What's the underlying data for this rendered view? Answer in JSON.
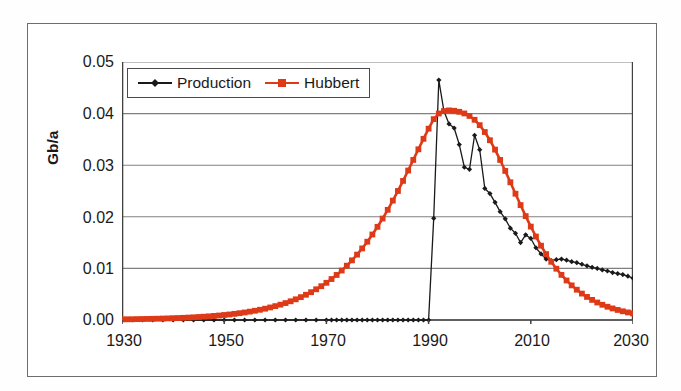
{
  "chart_data": {
    "type": "line",
    "title": "",
    "subtitle": "",
    "xlabel": "",
    "ylabel": "Gb/a",
    "xlim": [
      1930,
      2030
    ],
    "ylim": [
      0.0,
      0.05
    ],
    "xticks": [
      1930,
      1950,
      1970,
      1990,
      2010,
      2030
    ],
    "yticks": [
      "0.00",
      "0.01",
      "0.02",
      "0.03",
      "0.04",
      "0.05"
    ],
    "ytick_values": [
      0.0,
      0.01,
      0.02,
      0.03,
      0.04,
      0.05
    ],
    "grid": "horizontal",
    "legend_position": "upper-left-inside",
    "colors": {
      "production": "#1a1a1a",
      "hubbert": "#DE3A17",
      "gridline": "#808080",
      "axis": "#404040",
      "frame": "#6d6d6d",
      "background": "#ffffff"
    },
    "series": [
      {
        "name": "Production",
        "color": "#1a1a1a",
        "marker": "diamond",
        "x": [
          1930,
          1932,
          1934,
          1936,
          1938,
          1940,
          1942,
          1944,
          1946,
          1948,
          1950,
          1952,
          1954,
          1956,
          1958,
          1960,
          1962,
          1964,
          1966,
          1968,
          1970,
          1971,
          1972,
          1973,
          1974,
          1975,
          1976,
          1977,
          1978,
          1979,
          1980,
          1981,
          1982,
          1983,
          1984,
          1985,
          1986,
          1987,
          1988,
          1989,
          1990,
          1991,
          1992,
          1993,
          1994,
          1995,
          1996,
          1997,
          1998,
          1999,
          2000,
          2001,
          2002,
          2003,
          2004,
          2005,
          2006,
          2007,
          2008,
          2009,
          2010,
          2011,
          2012,
          2013,
          2014,
          2015,
          2016,
          2017,
          2018,
          2019,
          2020,
          2021,
          2022,
          2023,
          2024,
          2025,
          2026,
          2027,
          2028,
          2029,
          2030
        ],
        "y": [
          0.0,
          0.0,
          0.0,
          0.0,
          0.0,
          0.0,
          0.0,
          0.0,
          0.0,
          0.0,
          0.0,
          0.0,
          0.0,
          0.0,
          0.0,
          0.0,
          0.0,
          0.0,
          0.0,
          0.0,
          0.0,
          0.0,
          0.0,
          0.0,
          0.0,
          0.0,
          0.0,
          0.0,
          0.0,
          0.0,
          0.0,
          0.0,
          0.0,
          0.0,
          0.0,
          0.0,
          0.0,
          0.0,
          0.0,
          0.0,
          0.0,
          0.0197,
          0.0465,
          0.0405,
          0.038,
          0.0372,
          0.034,
          0.0296,
          0.0292,
          0.0358,
          0.033,
          0.0255,
          0.0245,
          0.0228,
          0.021,
          0.0196,
          0.0178,
          0.0168,
          0.015,
          0.0165,
          0.0158,
          0.014,
          0.0128,
          0.0118,
          0.0115,
          0.0117,
          0.0118,
          0.0116,
          0.0113,
          0.0111,
          0.0108,
          0.0105,
          0.0102,
          0.01,
          0.0097,
          0.0095,
          0.0092,
          0.009,
          0.0088,
          0.0085,
          0.0081
        ]
      },
      {
        "name": "Hubbert",
        "color": "#DE3A17",
        "marker": "square",
        "x": [
          1930,
          1931,
          1932,
          1933,
          1934,
          1935,
          1936,
          1937,
          1938,
          1939,
          1940,
          1941,
          1942,
          1943,
          1944,
          1945,
          1946,
          1947,
          1948,
          1949,
          1950,
          1951,
          1952,
          1953,
          1954,
          1955,
          1956,
          1957,
          1958,
          1959,
          1960,
          1961,
          1962,
          1963,
          1964,
          1965,
          1966,
          1967,
          1968,
          1969,
          1970,
          1971,
          1972,
          1973,
          1974,
          1975,
          1976,
          1977,
          1978,
          1979,
          1980,
          1981,
          1982,
          1983,
          1984,
          1985,
          1986,
          1987,
          1988,
          1989,
          1990,
          1991,
          1992,
          1993,
          1994,
          1995,
          1996,
          1997,
          1998,
          1999,
          2000,
          2001,
          2002,
          2003,
          2004,
          2005,
          2006,
          2007,
          2008,
          2009,
          2010,
          2011,
          2012,
          2013,
          2014,
          2015,
          2016,
          2017,
          2018,
          2019,
          2020,
          2021,
          2022,
          2023,
          2024,
          2025,
          2026,
          2027,
          2028,
          2029,
          2030
        ],
        "y": [
          0.00012,
          0.00014,
          0.00015,
          0.00017,
          0.00019,
          0.00021,
          0.00023,
          0.00025,
          0.00028,
          0.00031,
          0.00035,
          0.00038,
          0.00042,
          0.00047,
          0.00052,
          0.00058,
          0.00064,
          0.00071,
          0.00079,
          0.00087,
          0.00097,
          0.00107,
          0.00119,
          0.00132,
          0.00146,
          0.00162,
          0.00179,
          0.00198,
          0.00219,
          0.00243,
          0.00269,
          0.00297,
          0.00328,
          0.00363,
          0.00401,
          0.00443,
          0.00489,
          0.00539,
          0.00595,
          0.00655,
          0.00721,
          0.00794,
          0.00873,
          0.00959,
          0.01053,
          0.01156,
          0.01267,
          0.01387,
          0.01517,
          0.01657,
          0.01806,
          0.01966,
          0.02135,
          0.02314,
          0.02501,
          0.02696,
          0.02897,
          0.03102,
          0.03308,
          0.03511,
          0.03708,
          0.03893,
          0.04002,
          0.0405,
          0.04062,
          0.04055,
          0.04035,
          0.04003,
          0.03955,
          0.0388,
          0.03776,
          0.03643,
          0.03484,
          0.03302,
          0.03102,
          0.02889,
          0.02669,
          0.02447,
          0.02227,
          0.02013,
          0.0181,
          0.01618,
          0.0144,
          0.01277,
          0.01128,
          0.00994,
          0.00874,
          0.00766,
          0.00671,
          0.00587,
          0.00512,
          0.00447,
          0.0039,
          0.00339,
          0.00295,
          0.00257,
          0.00224,
          0.00195,
          0.00169,
          0.00147,
          0.00128
        ]
      }
    ]
  },
  "legend": {
    "entries": [
      {
        "label": "Production",
        "marker": "diamond",
        "color": "#1a1a1a"
      },
      {
        "label": "Hubbert",
        "marker": "square",
        "color": "#DE3A17"
      }
    ]
  },
  "axes": {
    "y_title": "Gb/a",
    "y_tick_labels": [
      "0.05",
      "0.04",
      "0.03",
      "0.02",
      "0.01",
      "0.00"
    ],
    "x_tick_labels": [
      "1930",
      "1950",
      "1970",
      "1990",
      "2010",
      "2030"
    ]
  }
}
